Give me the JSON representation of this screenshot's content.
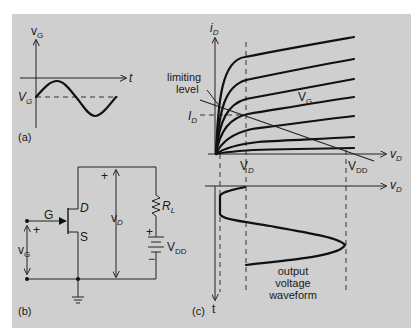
{
  "figure": {
    "background_color": "#cfcfcf",
    "line_color": "#111111"
  },
  "panel_a": {
    "label": "(a)",
    "y_axis_label": "v",
    "y_axis_sub": "G",
    "x_axis_label": "t",
    "bias_label": "V",
    "bias_sub": "G",
    "waveform": "sinusoid about V_G"
  },
  "panel_b": {
    "label": "(b)",
    "gate_label": "G",
    "drain_label": "D",
    "source_label": "S",
    "input_plus": "+",
    "input_label": "v",
    "input_sub": "G",
    "output_plus": "+",
    "output_label": "v",
    "output_sub": "D",
    "resistor_label": "R",
    "resistor_sub": "L",
    "supply_plus": "+",
    "supply_minus": "−",
    "supply_label": "V",
    "supply_sub": "DD"
  },
  "panel_c": {
    "label": "(c)",
    "y_axis_label": "i",
    "y_axis_sub": "D",
    "x_axis_label": "v",
    "x_axis_sub": "D",
    "lower_x_axis_label": "v",
    "lower_x_axis_sub": "D",
    "time_axis_label": "t",
    "limiting_label_line1": "limiting",
    "limiting_label_line2": "level",
    "quiescent_current_label": "I",
    "quiescent_current_sub": "D",
    "quiescent_voltage_label": "V",
    "quiescent_voltage_sub": "D",
    "supply_voltage_label": "V",
    "supply_voltage_sub": "DD",
    "curve_family_label": "V",
    "curve_family_sub": "G",
    "output_caption_line1": "output",
    "output_caption_line2": "voltage",
    "output_caption_line3": "waveform",
    "curve_count": 7
  }
}
